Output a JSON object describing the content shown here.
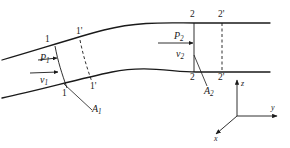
{
  "figure": {
    "kind": "fluid-flow-tube-diagram",
    "line_color": "#1a1a1a",
    "background_color": "#ffffff"
  },
  "labels": {
    "section1_top": "1",
    "section1_bottom": "1",
    "section1_prime_top": "1'",
    "section1_prime_bottom": "1'",
    "section2_top": "2",
    "section2_bottom": "2",
    "section2_prime_top": "2'",
    "section2_prime_bottom": "2'",
    "pressure1": "P",
    "pressure1_sub": "1",
    "velocity1": "v",
    "velocity1_sub": "1",
    "pressure2": "P",
    "pressure2_sub": "2",
    "velocity2": "v",
    "velocity2_sub": "2",
    "area1": "A",
    "area1_sub": "1",
    "area2": "A",
    "area2_sub": "2"
  },
  "axes": {
    "x_label": "x",
    "y_label": "y",
    "z_label": "z"
  }
}
